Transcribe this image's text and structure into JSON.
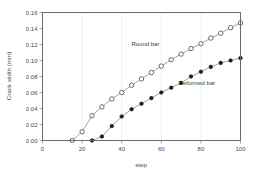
{
  "chart_data": {
    "type": "line",
    "title": "",
    "xlabel": "step",
    "ylabel": "Crack width (mm)",
    "xlim": [
      0,
      100
    ],
    "ylim": [
      0.0,
      0.16
    ],
    "xticks": [
      0,
      20,
      40,
      60,
      80,
      100
    ],
    "xtick_labels": [
      "0",
      "20",
      "40",
      "60",
      "80",
      "100"
    ],
    "yticks": [
      0.0,
      0.02,
      0.04,
      0.06,
      0.08,
      0.1,
      0.12,
      0.14,
      0.16
    ],
    "ytick_labels": [
      "0.00",
      "0.02",
      "0.04",
      "0.06",
      "0.08",
      "0.10",
      "0.12",
      "0.14",
      "0.16"
    ],
    "grid": "vertical-only",
    "legend_position": "inline-annotations",
    "series": [
      {
        "name": "Round bar",
        "marker": "open-circle",
        "label_text": "Round bar",
        "x": [
          15,
          20,
          25,
          30,
          35,
          40,
          45,
          50,
          55,
          60,
          65,
          70,
          75,
          80,
          85,
          90,
          95,
          100
        ],
        "values": [
          0.0,
          0.011,
          0.031,
          0.042,
          0.052,
          0.06,
          0.069,
          0.077,
          0.085,
          0.093,
          0.101,
          0.108,
          0.115,
          0.121,
          0.128,
          0.134,
          0.141,
          0.147
        ]
      },
      {
        "name": "Deformed bar",
        "marker": "filled-circle",
        "label_text": "Deformed bar",
        "x": [
          25,
          30,
          35,
          40,
          45,
          50,
          55,
          60,
          65,
          70,
          75,
          80,
          85,
          90,
          95,
          100
        ],
        "values": [
          0.0,
          0.005,
          0.018,
          0.03,
          0.039,
          0.046,
          0.053,
          0.06,
          0.066,
          0.072,
          0.08,
          0.086,
          0.092,
          0.097,
          0.1,
          0.103
        ]
      }
    ],
    "annotations": [
      {
        "text": "Round bar",
        "x": 52,
        "y": 0.118
      },
      {
        "text": "Deformed bar",
        "x": 78,
        "y": 0.069
      }
    ],
    "colors": {
      "line": "#7d7d7d",
      "frame": "#6b6b6b",
      "grid": "#e9e9ec",
      "text": "#4a4a4a",
      "marker_fill_open": "#ffffff",
      "marker_fill_closed": "#1a1a1a",
      "background": "#ffffff"
    }
  }
}
